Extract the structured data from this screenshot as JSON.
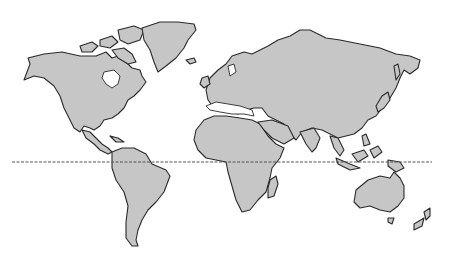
{
  "map": {
    "title": "World map",
    "style": "grayscale outline",
    "colors": {
      "land": "#c6c6c6",
      "outline": "#2a2a2a",
      "ocean": "#ffffff",
      "equator": "#555555"
    },
    "features": {
      "equator": {
        "label": "Equator",
        "y": 162,
        "x_start": 12,
        "x_end": 432
      },
      "continents": [
        "North America",
        "Greenland",
        "South America",
        "Europe",
        "Africa",
        "Asia",
        "Australia",
        "New Zealand",
        "Madagascar",
        "Maritime Southeast Asia",
        "Japan",
        "Antarctic islands"
      ]
    }
  }
}
